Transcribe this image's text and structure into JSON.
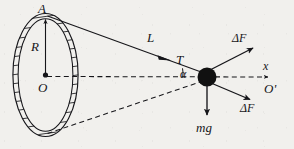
{
  "figure": {
    "type": "physics-free-body-diagram",
    "background_color": "#f1f0ed",
    "ink_color": "#16161a"
  },
  "labels": {
    "apex_point": "A",
    "radius": "R",
    "center": "O",
    "string_length": "L",
    "tension": "T",
    "angle": "α",
    "delta_force_upper": "ΔF",
    "delta_force_lower": "ΔF",
    "axis_x": "x",
    "origin_prime": "O'",
    "weight": "mg"
  },
  "geometry": {
    "ring": {
      "center_x": 45.5,
      "center_y": 75,
      "radius_x": 32,
      "radius_y": 60,
      "band_thickness": 4.5,
      "hatched": true
    },
    "apex": {
      "x": 45.5,
      "y": 15
    },
    "center_point": {
      "x": 45.5,
      "y": 75
    },
    "bead": {
      "x": 207,
      "y": 77,
      "radius": 9.5,
      "fill": "#111111"
    },
    "x_axis_arrow_tip": {
      "x": 272,
      "y": 77
    },
    "weight_arrow_tip": {
      "x": 207,
      "y": 119
    },
    "delta_f_upper_tip": {
      "x": 256,
      "y": 46
    },
    "delta_f_lower_tip": {
      "x": 253,
      "y": 101
    },
    "ring_bottom": {
      "x": 47,
      "y": 134
    }
  }
}
